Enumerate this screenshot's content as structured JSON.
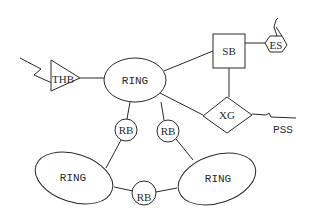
{
  "diagram": {
    "type": "network-topology",
    "nodes": [
      {
        "id": "ring_top",
        "shape": "ellipse",
        "label": "RING"
      },
      {
        "id": "ring_bottom_left",
        "shape": "ellipse",
        "label": "RING"
      },
      {
        "id": "ring_bottom_right",
        "shape": "ellipse",
        "label": "RING"
      },
      {
        "id": "rb_left",
        "shape": "circle",
        "label": "RB"
      },
      {
        "id": "rb_right",
        "shape": "circle",
        "label": "RB"
      },
      {
        "id": "rb_bottom",
        "shape": "circle",
        "label": "RB"
      },
      {
        "id": "thb",
        "shape": "triangle",
        "label": "THB"
      },
      {
        "id": "sb",
        "shape": "square",
        "label": "SB"
      },
      {
        "id": "es",
        "shape": "hexagon",
        "label": "ES"
      },
      {
        "id": "xg",
        "shape": "diamond",
        "label": "XG"
      }
    ],
    "external_labels": {
      "pss": "PSS"
    },
    "edges": [
      [
        "thb",
        "ring_top"
      ],
      [
        "ring_top",
        "sb"
      ],
      [
        "sb",
        "es"
      ],
      [
        "sb",
        "xg"
      ],
      [
        "ring_top",
        "xg"
      ],
      [
        "xg",
        "PSS"
      ],
      [
        "ring_top",
        "rb_left"
      ],
      [
        "ring_top",
        "rb_right"
      ],
      [
        "rb_left",
        "ring_bottom_left"
      ],
      [
        "rb_right",
        "ring_bottom_right"
      ],
      [
        "ring_bottom_left",
        "rb_bottom"
      ],
      [
        "rb_bottom",
        "ring_bottom_right"
      ]
    ],
    "labels": {
      "ring_top": "RING",
      "ring_bottom_left": "RING",
      "ring_bottom_right": "RING",
      "rb_left": "RB",
      "rb_right": "RB",
      "rb_bottom": "RB",
      "thb": "THB",
      "sb": "SB",
      "es": "ES",
      "xg": "XG",
      "pss": "PSS"
    }
  }
}
